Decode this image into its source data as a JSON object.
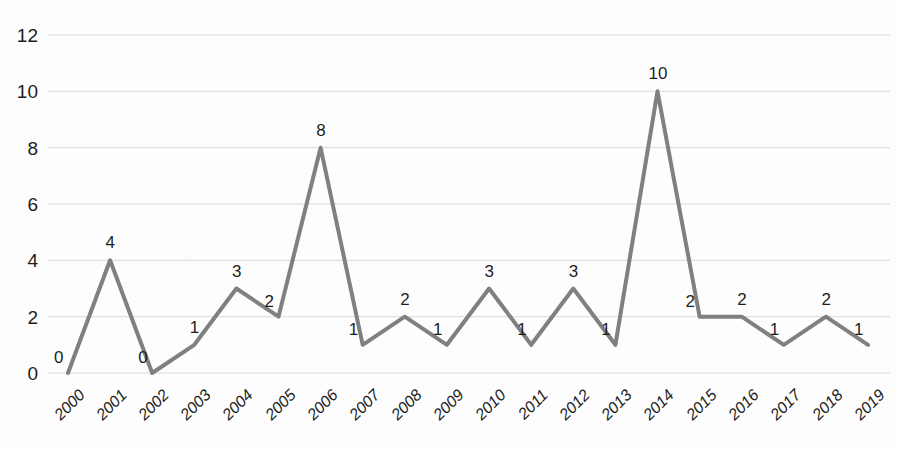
{
  "chart_data": {
    "type": "line",
    "title": "",
    "subtitle": "",
    "xlabel": "",
    "ylabel": "",
    "categories": [
      "2000",
      "2001",
      "2002",
      "2003",
      "2004",
      "2005",
      "2006",
      "2007",
      "2008",
      "2009",
      "2010",
      "2011",
      "2012",
      "2013",
      "2014",
      "2015",
      "2016",
      "2017",
      "2018",
      "2019"
    ],
    "values": [
      0,
      4,
      0,
      1,
      3,
      2,
      8,
      1,
      2,
      1,
      3,
      1,
      3,
      1,
      10,
      2,
      2,
      1,
      2,
      1
    ],
    "data_labels": [
      "0",
      "4",
      "0",
      "1",
      "3",
      "2",
      "8",
      "1",
      "2",
      "1",
      "3",
      "1",
      "3",
      "1",
      "10",
      "2",
      "2",
      "1",
      "2",
      "1"
    ],
    "y_ticks": [
      0,
      2,
      4,
      6,
      8,
      10,
      12
    ],
    "y_tick_labels": [
      "0",
      "2",
      "4",
      "6",
      "8",
      "10",
      "12"
    ],
    "ylim": [
      0,
      12
    ],
    "grid": true,
    "grid_axis": "y",
    "legend": false,
    "legend_position": "none",
    "annotations": [],
    "series": [
      {
        "name": "",
        "values": [
          0,
          4,
          0,
          1,
          3,
          2,
          8,
          1,
          2,
          1,
          3,
          1,
          3,
          1,
          10,
          2,
          2,
          1,
          2,
          1
        ],
        "color": "#808080",
        "line_width": 4,
        "markers": false
      }
    ],
    "colors": {
      "line": "#808080",
      "grid": "#d9d9d9",
      "text": "#1d1d1d",
      "background": "#fdfdfd"
    }
  }
}
